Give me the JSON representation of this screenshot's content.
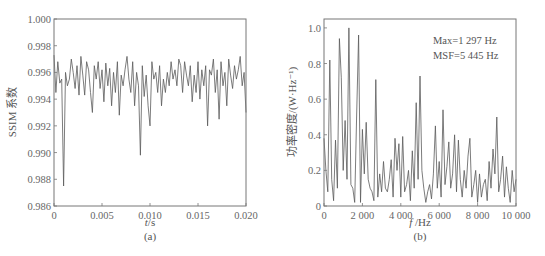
{
  "chart_data": [
    {
      "type": "line",
      "panel_label": "(a)",
      "title": "",
      "xlabel": "t/s",
      "ylabel": "SSIM 系数",
      "xlim": [
        0,
        0.02
      ],
      "ylim": [
        0.986,
        1.0
      ],
      "xticks": [
        "0",
        "0.005",
        "0.010",
        "0.015",
        "0.020"
      ],
      "yticks": [
        "0.986",
        "0.988",
        "0.990",
        "0.992",
        "0.994",
        "0.996",
        "0.998",
        "1.000"
      ],
      "grid": false,
      "series": [
        {
          "name": "SSIM",
          "x": [
            0,
            0.0002,
            0.0004,
            0.0006,
            0.0008,
            0.001,
            0.0012,
            0.0014,
            0.0016,
            0.0018,
            0.002,
            0.0022,
            0.0024,
            0.0026,
            0.0028,
            0.003,
            0.0032,
            0.0034,
            0.0036,
            0.0038,
            0.004,
            0.0042,
            0.0044,
            0.0046,
            0.0048,
            0.005,
            0.0052,
            0.0054,
            0.0056,
            0.0058,
            0.006,
            0.0062,
            0.0064,
            0.0066,
            0.0068,
            0.007,
            0.0072,
            0.0074,
            0.0076,
            0.0078,
            0.008,
            0.0082,
            0.0084,
            0.0086,
            0.0088,
            0.009,
            0.0092,
            0.0094,
            0.0096,
            0.0098,
            0.01,
            0.0102,
            0.0104,
            0.0106,
            0.0108,
            0.011,
            0.0112,
            0.0114,
            0.0116,
            0.0118,
            0.012,
            0.0122,
            0.0124,
            0.0126,
            0.0128,
            0.013,
            0.0132,
            0.0134,
            0.0136,
            0.0138,
            0.014,
            0.0142,
            0.0144,
            0.0146,
            0.0148,
            0.015,
            0.0152,
            0.0154,
            0.0156,
            0.0158,
            0.016,
            0.0162,
            0.0164,
            0.0166,
            0.0168,
            0.017,
            0.0172,
            0.0174,
            0.0176,
            0.0178,
            0.018,
            0.0182,
            0.0184,
            0.0186,
            0.0188,
            0.019,
            0.0192,
            0.0194,
            0.0196,
            0.0198,
            0.02
          ],
          "y": [
            0.9973,
            0.9945,
            0.9968,
            0.9952,
            0.9955,
            0.9875,
            0.996,
            0.995,
            0.9955,
            0.997,
            0.996,
            0.9948,
            0.9965,
            0.9943,
            0.9972,
            0.9958,
            0.9943,
            0.9968,
            0.9962,
            0.9945,
            0.993,
            0.9965,
            0.9955,
            0.9968,
            0.9948,
            0.9962,
            0.9938,
            0.9967,
            0.995,
            0.9963,
            0.9935,
            0.996,
            0.9945,
            0.9968,
            0.9928,
            0.9958,
            0.995,
            0.9962,
            0.9972,
            0.9955,
            0.9945,
            0.9968,
            0.9935,
            0.996,
            0.995,
            0.9898,
            0.9965,
            0.9942,
            0.9958,
            0.9935,
            0.992,
            0.9968,
            0.9955,
            0.996,
            0.9945,
            0.9965,
            0.9935,
            0.9955,
            0.9945,
            0.996,
            0.995,
            0.9968,
            0.9955,
            0.9962,
            0.995,
            0.997,
            0.9965,
            0.9945,
            0.9968,
            0.9958,
            0.995,
            0.9965,
            0.9938,
            0.9958,
            0.9945,
            0.9968,
            0.994,
            0.9962,
            0.995,
            0.9965,
            0.992,
            0.9962,
            0.9958,
            0.997,
            0.9945,
            0.9962,
            0.9925,
            0.9968,
            0.995,
            0.996,
            0.9935,
            0.997,
            0.9958,
            0.9948,
            0.9965,
            0.9955,
            0.9962,
            0.9972,
            0.995,
            0.996,
            0.993
          ]
        }
      ]
    },
    {
      "type": "line",
      "panel_label": "(b)",
      "title": "",
      "xlabel": "f /Hz",
      "ylabel": "功率密度/(W·Hz⁻¹)",
      "xlim": [
        0,
        10000
      ],
      "ylim": [
        0,
        1.05
      ],
      "xticks": [
        "0",
        "2 000",
        "4 000",
        "6 000",
        "8 000",
        "10 000"
      ],
      "yticks": [
        "0",
        "0.2",
        "0.4",
        "0.6",
        "0.8",
        "1.0"
      ],
      "grid": false,
      "annotations": [
        "Max=1 297 Hz",
        "MSF=5 445 Hz"
      ],
      "series": [
        {
          "name": "Power density",
          "x": [
            0,
            100,
            200,
            300,
            400,
            500,
            600,
            700,
            800,
            900,
            1000,
            1100,
            1200,
            1297,
            1400,
            1500,
            1600,
            1700,
            1800,
            1900,
            2000,
            2100,
            2200,
            2300,
            2400,
            2500,
            2600,
            2700,
            2800,
            2900,
            3000,
            3100,
            3200,
            3300,
            3400,
            3500,
            3600,
            3700,
            3800,
            3900,
            4000,
            4100,
            4200,
            4300,
            4400,
            4500,
            4600,
            4700,
            4800,
            4900,
            5000,
            5100,
            5200,
            5300,
            5400,
            5500,
            5600,
            5700,
            5800,
            5900,
            6000,
            6100,
            6200,
            6300,
            6400,
            6500,
            6600,
            6700,
            6800,
            6900,
            7000,
            7100,
            7200,
            7300,
            7400,
            7500,
            7600,
            7700,
            7800,
            7900,
            8000,
            8100,
            8200,
            8300,
            8400,
            8500,
            8600,
            8700,
            8800,
            8900,
            9000,
            9100,
            9200,
            9300,
            9400,
            9500,
            9600,
            9700,
            9800,
            9900,
            10000
          ],
          "y": [
            0.38,
            0.2,
            0.08,
            0.82,
            0.15,
            0.03,
            0.37,
            0.1,
            0.94,
            0.72,
            0.2,
            0.48,
            0.15,
            1.0,
            0.12,
            0.1,
            0.02,
            0.5,
            0.96,
            0.02,
            0.43,
            0.18,
            0.47,
            0.15,
            0.1,
            0.08,
            0.03,
            0.71,
            0.05,
            0.18,
            0.08,
            0.25,
            0.1,
            0.08,
            0.15,
            0.26,
            0.05,
            0.38,
            0.2,
            0.35,
            0.05,
            0.39,
            0.08,
            0.12,
            0.2,
            0.03,
            0.31,
            0.1,
            0.58,
            0.15,
            0.73,
            0.2,
            0.1,
            0.02,
            0.08,
            0.12,
            0.04,
            0.18,
            0.45,
            0.1,
            0.25,
            0.05,
            0.54,
            0.12,
            0.22,
            0.36,
            0.1,
            0.18,
            0.4,
            0.08,
            0.37,
            0.15,
            0.05,
            0.2,
            0.1,
            0.28,
            0.38,
            0.05,
            0.12,
            0.2,
            0.02,
            0.18,
            0.05,
            0.12,
            0.15,
            0.03,
            0.25,
            0.1,
            0.32,
            0.18,
            0.5,
            0.08,
            0.15,
            0.28,
            0.05,
            0.22,
            0.1,
            0.02,
            0.2,
            0.08,
            0.15
          ]
        }
      ]
    }
  ],
  "panels": {
    "a": {
      "label": "(a)",
      "xlabel_italic": "t",
      "xlabel_unit": "/s",
      "ylabel": "SSIM 系数"
    },
    "b": {
      "label": "(b)",
      "xlabel_italic": "f",
      "xlabel_unit": " /Hz",
      "ylabel": "功率密度/(W·Hz⁻¹)",
      "annotation_1": "Max=1 297 Hz",
      "annotation_2": "MSF=5 445 Hz"
    }
  },
  "style": {
    "line_color": "#555555",
    "axis_color": "#666666"
  }
}
